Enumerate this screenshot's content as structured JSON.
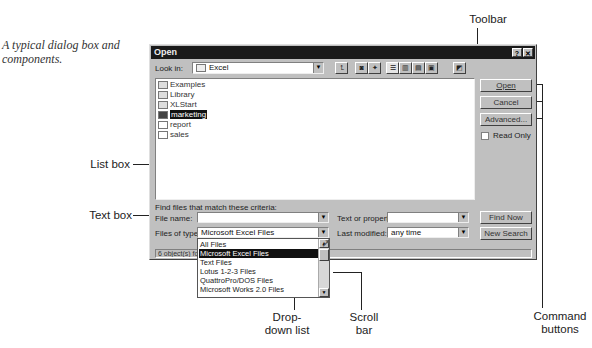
{
  "caption": "A typical dialog box and components.",
  "callouts": {
    "toolbar": "Toolbar",
    "list_box": "List box",
    "text_box": "Text box",
    "drop_down_list": "Drop-down list",
    "scroll_bar": "Scroll bar",
    "command_buttons": "Command buttons"
  },
  "dialog": {
    "title": "Open",
    "help_button": "?",
    "close_button": "✕",
    "look_in_label": "Look in:",
    "look_in_value": "Excel",
    "toolbar_icons": [
      "up-one-level-icon",
      "search-web-icon",
      "add-favorites-icon",
      "list-view-icon",
      "details-view-icon",
      "properties-view-icon",
      "preview-view-icon",
      "commands-settings-icon"
    ],
    "files": [
      {
        "name": "Examples",
        "type": "folder",
        "selected": false
      },
      {
        "name": "Library",
        "type": "folder",
        "selected": false
      },
      {
        "name": "XLStart",
        "type": "folder",
        "selected": false
      },
      {
        "name": "marketing",
        "type": "excel",
        "selected": true
      },
      {
        "name": "report",
        "type": "excel",
        "selected": false
      },
      {
        "name": "sales",
        "type": "excel",
        "selected": false
      }
    ],
    "buttons": {
      "open": "Open",
      "cancel": "Cancel",
      "advanced": "Advanced...",
      "read_only": "Read Only",
      "find_now": "Find Now",
      "new_search": "New Search"
    },
    "criteria_heading": "Find files that match these criteria:",
    "file_name_label": "File name:",
    "file_name_value": "",
    "files_of_type_label": "Files of type:",
    "files_of_type_value": "Microsoft Excel Files",
    "text_property_label": "Text or property:",
    "text_property_value": "",
    "last_modified_label": "Last modified:",
    "last_modified_value": "any time",
    "status": "6 object(s) found.",
    "file_type_options": [
      "All Files",
      "Microsoft Excel Files",
      "Text Files",
      "Lotus 1-2-3 Files",
      "QuattroPro/DOS Files",
      "Microsoft Works 2.0 Files"
    ]
  }
}
